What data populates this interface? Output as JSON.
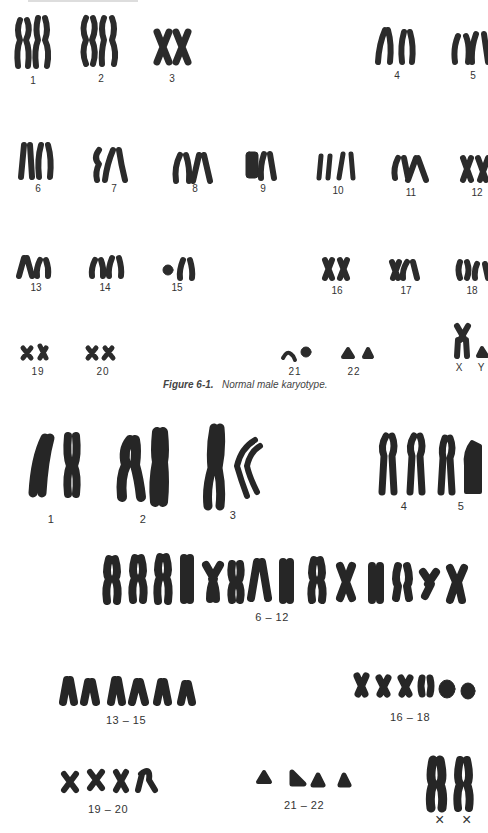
{
  "figure1": {
    "caption_number": "Figure 6-1.",
    "caption_text": "Normal male karyotype.",
    "chromosome_color": "#2b2b2b",
    "rows": [
      {
        "labels": [
          {
            "text": "1",
            "x": 33,
            "y": 75
          },
          {
            "text": "2",
            "x": 101,
            "y": 73
          },
          {
            "text": "3",
            "x": 172,
            "y": 73
          },
          {
            "text": "4",
            "x": 397,
            "y": 70
          },
          {
            "text": "5",
            "x": 473,
            "y": 70
          }
        ]
      },
      {
        "labels": [
          {
            "text": "6",
            "x": 38,
            "y": 183
          },
          {
            "text": "7",
            "x": 114,
            "y": 183
          },
          {
            "text": "8",
            "x": 195,
            "y": 183
          },
          {
            "text": "9",
            "x": 263,
            "y": 183
          },
          {
            "text": "10",
            "x": 338,
            "y": 185
          },
          {
            "text": "11",
            "x": 411,
            "y": 187
          },
          {
            "text": "12",
            "x": 477,
            "y": 187
          }
        ]
      },
      {
        "labels": [
          {
            "text": "13",
            "x": 36,
            "y": 282
          },
          {
            "text": "14",
            "x": 105,
            "y": 282
          },
          {
            "text": "15",
            "x": 177,
            "y": 282
          },
          {
            "text": "16",
            "x": 337,
            "y": 285
          },
          {
            "text": "17",
            "x": 406,
            "y": 285
          },
          {
            "text": "18",
            "x": 472,
            "y": 285
          }
        ]
      },
      {
        "labels": [
          {
            "text": "19",
            "x": 38,
            "y": 366
          },
          {
            "text": "20",
            "x": 103,
            "y": 366
          },
          {
            "text": "21",
            "x": 295,
            "y": 366
          },
          {
            "text": "22",
            "x": 354,
            "y": 366
          },
          {
            "text": "X",
            "x": 459,
            "y": 362
          },
          {
            "text": "Y",
            "x": 481,
            "y": 362
          }
        ]
      }
    ]
  },
  "figure2": {
    "group_labels": [
      {
        "text": "1",
        "x": 51,
        "y": 516
      },
      {
        "text": "2",
        "x": 143,
        "y": 516
      },
      {
        "text": "3",
        "x": 233,
        "y": 512
      },
      {
        "text": "4",
        "x": 404,
        "y": 503
      },
      {
        "text": "5",
        "x": 461,
        "y": 503
      },
      {
        "text": "6 – 12",
        "x": 272,
        "y": 613
      },
      {
        "text": "13 – 15",
        "x": 126,
        "y": 717
      },
      {
        "text": "16 – 18",
        "x": 410,
        "y": 714
      },
      {
        "text": "19 – 20",
        "x": 108,
        "y": 806
      },
      {
        "text": "21 – 22",
        "x": 304,
        "y": 802
      },
      {
        "text": "×",
        "x": 440,
        "y": 815
      },
      {
        "text": "×",
        "x": 467,
        "y": 815
      }
    ]
  }
}
